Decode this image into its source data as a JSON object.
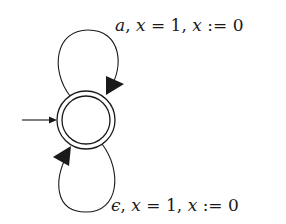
{
  "diagram": {
    "type": "timed-automaton",
    "states": [
      {
        "id": "q0",
        "initial": true,
        "accepting": true,
        "label": ""
      }
    ],
    "transitions": [
      {
        "from": "q0",
        "to": "q0",
        "position": "top",
        "label": "a, x = 1, x := 0",
        "parts": {
          "action": "a",
          "sep1": ", ",
          "guard_var": "x",
          "guard_op": " = ",
          "guard_val": "1",
          "sep2": ", ",
          "reset_var": "x",
          "reset_op": " := ",
          "reset_val": "0"
        }
      },
      {
        "from": "q0",
        "to": "q0",
        "position": "bottom",
        "label": "ϵ, x = 1, x := 0",
        "parts": {
          "action": "ϵ",
          "sep1": ", ",
          "guard_var": "x",
          "guard_op": " = ",
          "guard_val": "1",
          "sep2": ", ",
          "reset_var": "x",
          "reset_op": " := ",
          "reset_val": "0"
        }
      }
    ],
    "colors": {
      "stroke": "#1a1a1a",
      "background": "#ffffff"
    }
  }
}
